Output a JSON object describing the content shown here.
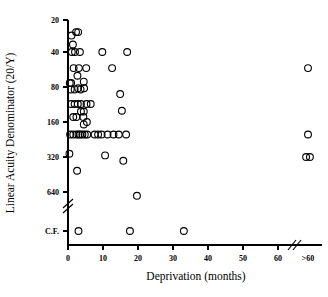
{
  "chart_data": {
    "type": "scatter",
    "title": "",
    "xlabel": "Deprivation (months)",
    "ylabel": "Linear Acuity Denominator (20/Y)",
    "grid": false,
    "legend": null,
    "marker": "open-circle",
    "xlim": [
      0,
      64
    ],
    "xticks": [
      0,
      10,
      20,
      30,
      40,
      50,
      60
    ],
    "xticklabels": [
      "0",
      "10",
      "20",
      "30",
      "40",
      "50",
      "60"
    ],
    "x_axis_break": true,
    "x_break_label": ">60",
    "x_break_note": "axis break after 60; rightmost category is >60 months",
    "yticks": [
      20,
      40,
      80,
      160,
      320,
      640
    ],
    "yticklabels": [
      "20",
      "40",
      "80",
      "160",
      "320",
      "640"
    ],
    "y_scale": "log2",
    "y_axis_break": true,
    "y_break_label": "C.F.",
    "y_break_note": "axis break below 640; bottom category C.F. = counts fingers",
    "points": [
      {
        "x": 1.0,
        "y": 28
      },
      {
        "x": 1.4,
        "y": 34
      },
      {
        "x": 2.3,
        "y": 26
      },
      {
        "x": 2.9,
        "y": 26
      },
      {
        "x": 1.1,
        "y": 40
      },
      {
        "x": 2.0,
        "y": 40
      },
      {
        "x": 3.4,
        "y": 40
      },
      {
        "x": 9.8,
        "y": 40
      },
      {
        "x": 16.9,
        "y": 40
      },
      {
        "x": 1.6,
        "y": 55
      },
      {
        "x": 3.1,
        "y": 55
      },
      {
        "x": 5.2,
        "y": 55
      },
      {
        "x": 12.6,
        "y": 55
      },
      {
        "x": 62.0,
        "y": 55
      },
      {
        "x": 2.7,
        "y": 64
      },
      {
        "x": 0.5,
        "y": 74
      },
      {
        "x": 0.9,
        "y": 74
      },
      {
        "x": 4.5,
        "y": 72
      },
      {
        "x": 0.8,
        "y": 84
      },
      {
        "x": 1.9,
        "y": 84
      },
      {
        "x": 2.9,
        "y": 82
      },
      {
        "x": 3.6,
        "y": 84
      },
      {
        "x": 4.6,
        "y": 82
      },
      {
        "x": 0.9,
        "y": 112
      },
      {
        "x": 1.9,
        "y": 112
      },
      {
        "x": 2.8,
        "y": 112
      },
      {
        "x": 3.7,
        "y": 112
      },
      {
        "x": 5.3,
        "y": 112
      },
      {
        "x": 6.5,
        "y": 112
      },
      {
        "x": 14.9,
        "y": 92
      },
      {
        "x": 3.7,
        "y": 130
      },
      {
        "x": 4.5,
        "y": 130
      },
      {
        "x": 15.4,
        "y": 128
      },
      {
        "x": 1.5,
        "y": 145
      },
      {
        "x": 2.4,
        "y": 145
      },
      {
        "x": 4.4,
        "y": 145
      },
      {
        "x": 4.5,
        "y": 168
      },
      {
        "x": 5.4,
        "y": 160
      },
      {
        "x": 0.6,
        "y": 205
      },
      {
        "x": 1.5,
        "y": 205
      },
      {
        "x": 2.4,
        "y": 205
      },
      {
        "x": 3.0,
        "y": 205
      },
      {
        "x": 3.5,
        "y": 205
      },
      {
        "x": 4.1,
        "y": 205
      },
      {
        "x": 4.8,
        "y": 205
      },
      {
        "x": 5.5,
        "y": 205
      },
      {
        "x": 7.6,
        "y": 205
      },
      {
        "x": 8.6,
        "y": 205
      },
      {
        "x": 9.6,
        "y": 205
      },
      {
        "x": 11.3,
        "y": 205
      },
      {
        "x": 13.0,
        "y": 205
      },
      {
        "x": 14.5,
        "y": 205
      },
      {
        "x": 16.6,
        "y": 205
      },
      {
        "x": 62.0,
        "y": 205
      },
      {
        "x": 0.4,
        "y": 300
      },
      {
        "x": 10.6,
        "y": 310
      },
      {
        "x": 15.8,
        "y": 345
      },
      {
        "x": 2.6,
        "y": 420
      },
      {
        "x": 61.4,
        "y": 320
      },
      {
        "x": 62.6,
        "y": 320
      },
      {
        "x": 19.7,
        "y": 690
      },
      {
        "x": 3.0,
        "y": "C.F."
      },
      {
        "x": 17.7,
        "y": "C.F."
      },
      {
        "x": 33.1,
        "y": "C.F."
      }
    ]
  }
}
